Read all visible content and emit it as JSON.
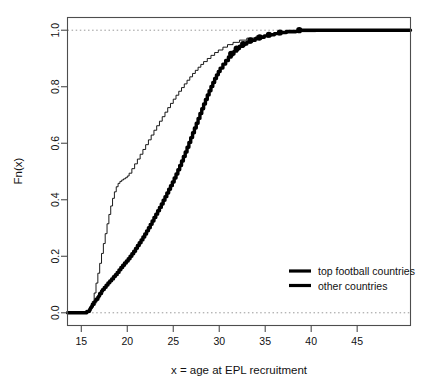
{
  "chart_data": {
    "type": "line",
    "title": "",
    "subtitle": "",
    "xlabel": "x = age at EPL recruitment",
    "ylabel": "Fn(x)",
    "xlim": [
      13.5,
      50.8
    ],
    "ylim": [
      -0.045,
      1.045
    ],
    "xticks": [
      15,
      20,
      25,
      30,
      35,
      40,
      45
    ],
    "xticklabels": [
      "15",
      "20",
      "25",
      "30",
      "35",
      "40",
      "45"
    ],
    "yticks": [
      0.0,
      0.2,
      0.4,
      0.6,
      0.8,
      1.0
    ],
    "yticklabels": [
      "0.0",
      "0.2",
      "0.4",
      "0.6",
      "0.8",
      "1.0"
    ],
    "grid": false,
    "reference_lines": [
      {
        "name": "zero-line",
        "y": 0.0,
        "style": "dotted",
        "color": "#999999"
      },
      {
        "name": "one-line",
        "y": 1.0,
        "style": "dotted",
        "color": "#999999"
      }
    ],
    "legend": {
      "position": "bottom-right",
      "entries": [
        {
          "label": "top football countries",
          "color": "#000000",
          "linewidth": 3.2
        },
        {
          "label": "other countries",
          "color": "#000000",
          "linewidth": 3.2
        }
      ]
    },
    "series": [
      {
        "name": "top football countries",
        "style": "thick-step-ecdf",
        "color": "#000000",
        "linewidth": 3.4,
        "markers": true,
        "x": [
          15.6,
          15.9,
          16.0,
          16.1,
          16.2,
          16.4,
          16.5,
          16.6,
          16.8,
          16.9,
          17.0,
          17.2,
          17.3,
          17.5,
          17.7,
          17.9,
          18.1,
          18.3,
          18.5,
          18.7,
          18.9,
          19.1,
          19.3,
          19.5,
          19.7,
          19.9,
          20.1,
          20.3,
          20.5,
          20.7,
          20.9,
          21.1,
          21.3,
          21.5,
          21.7,
          21.9,
          22.1,
          22.3,
          22.5,
          22.7,
          22.9,
          23.1,
          23.3,
          23.5,
          23.7,
          23.9,
          24.1,
          24.3,
          24.5,
          24.7,
          24.9,
          25.1,
          25.3,
          25.5,
          25.7,
          25.9,
          26.1,
          26.3,
          26.5,
          26.7,
          26.9,
          27.1,
          27.3,
          27.5,
          27.7,
          27.9,
          28.1,
          28.3,
          28.5,
          28.7,
          28.9,
          29.1,
          29.3,
          29.5,
          29.7,
          29.9,
          30.1,
          30.4,
          30.7,
          31.0,
          31.3,
          31.6,
          31.9,
          32.2,
          32.6,
          33.0,
          33.4,
          33.9,
          34.4,
          34.9,
          35.4,
          36.0,
          36.6,
          37.3,
          38.7
        ],
        "y": [
          0.005,
          0.012,
          0.018,
          0.022,
          0.03,
          0.037,
          0.042,
          0.048,
          0.055,
          0.06,
          0.068,
          0.076,
          0.082,
          0.09,
          0.098,
          0.106,
          0.113,
          0.12,
          0.128,
          0.135,
          0.143,
          0.152,
          0.16,
          0.168,
          0.176,
          0.183,
          0.191,
          0.2,
          0.209,
          0.218,
          0.228,
          0.238,
          0.248,
          0.258,
          0.268,
          0.279,
          0.29,
          0.301,
          0.313,
          0.325,
          0.337,
          0.349,
          0.361,
          0.373,
          0.385,
          0.398,
          0.411,
          0.424,
          0.437,
          0.45,
          0.463,
          0.477,
          0.491,
          0.506,
          0.521,
          0.537,
          0.553,
          0.569,
          0.586,
          0.603,
          0.62,
          0.637,
          0.654,
          0.671,
          0.688,
          0.705,
          0.722,
          0.739,
          0.755,
          0.771,
          0.786,
          0.801,
          0.815,
          0.829,
          0.842,
          0.854,
          0.866,
          0.88,
          0.893,
          0.905,
          0.916,
          0.926,
          0.935,
          0.943,
          0.951,
          0.958,
          0.964,
          0.97,
          0.975,
          0.98,
          0.984,
          0.988,
          0.992,
          0.996,
          1.0
        ],
        "marker_points": [
          {
            "x": 31.3,
            "y": 0.916
          },
          {
            "x": 31.9,
            "y": 0.935
          },
          {
            "x": 32.6,
            "y": 0.951
          },
          {
            "x": 33.4,
            "y": 0.964
          },
          {
            "x": 34.4,
            "y": 0.975
          },
          {
            "x": 35.4,
            "y": 0.984
          },
          {
            "x": 36.6,
            "y": 0.992
          },
          {
            "x": 38.7,
            "y": 1.0
          }
        ]
      },
      {
        "name": "other countries",
        "style": "thin-step-ecdf",
        "color": "#000000",
        "linewidth": 0.9,
        "markers": false,
        "x": [
          15.3,
          15.7,
          16.0,
          16.2,
          16.4,
          16.6,
          16.8,
          17.0,
          17.2,
          17.4,
          17.6,
          17.8,
          18.0,
          18.2,
          18.4,
          18.6,
          18.8,
          19.0,
          19.2,
          19.4,
          19.6,
          19.8,
          20.0,
          20.2,
          20.5,
          20.8,
          21.1,
          21.4,
          21.7,
          22.0,
          22.3,
          22.6,
          22.9,
          23.2,
          23.5,
          23.8,
          24.1,
          24.4,
          24.7,
          25.0,
          25.3,
          25.6,
          25.9,
          26.2,
          26.5,
          26.8,
          27.1,
          27.4,
          27.7,
          28.0,
          28.3,
          28.7,
          29.1,
          29.5,
          29.9,
          30.4,
          30.9,
          31.5,
          32.2,
          33.0,
          34.0,
          35.2,
          36.6,
          38.4,
          40.5
        ],
        "y": [
          0.003,
          0.008,
          0.02,
          0.04,
          0.07,
          0.105,
          0.14,
          0.175,
          0.21,
          0.245,
          0.28,
          0.315,
          0.348,
          0.378,
          0.405,
          0.428,
          0.446,
          0.458,
          0.465,
          0.47,
          0.474,
          0.478,
          0.484,
          0.494,
          0.51,
          0.527,
          0.544,
          0.561,
          0.578,
          0.595,
          0.612,
          0.629,
          0.646,
          0.662,
          0.678,
          0.694,
          0.71,
          0.726,
          0.741,
          0.756,
          0.77,
          0.784,
          0.797,
          0.81,
          0.823,
          0.835,
          0.847,
          0.858,
          0.869,
          0.879,
          0.889,
          0.9,
          0.911,
          0.921,
          0.93,
          0.94,
          0.949,
          0.957,
          0.965,
          0.972,
          0.979,
          0.985,
          0.99,
          0.995,
          1.0
        ]
      }
    ]
  },
  "axes": {
    "xlabel": "x = age at EPL recruitment",
    "ylabel": "Fn(x)"
  }
}
